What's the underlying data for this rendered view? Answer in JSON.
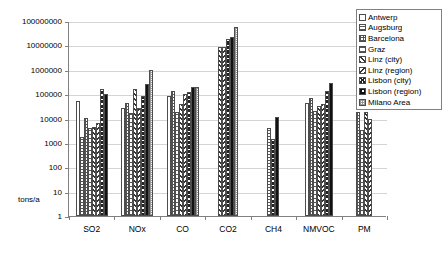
{
  "chart_data": {
    "type": "bar",
    "title": "",
    "subtitle": "",
    "xlabel": "",
    "ylabel": "tons/a",
    "yscale": "log",
    "ylim": [
      1,
      100000000
    ],
    "grid": true,
    "legend_position": "top-right",
    "ytick_labels": [
      "100000000",
      "10000000",
      "1000000",
      "100000",
      "10000",
      "1000",
      "100",
      "10",
      "1"
    ],
    "ytick_values": [
      100000000,
      10000000,
      1000000,
      100000,
      10000,
      1000,
      100,
      10,
      1
    ],
    "categories": [
      "SO2",
      "NOx",
      "CO",
      "CO2",
      "CH4",
      "NMVOC",
      "PM"
    ],
    "series": [
      {
        "name": "Antwerp",
        "pattern": "solid-white",
        "values": [
          50000,
          27000,
          85000,
          null,
          null,
          42000,
          null
        ]
      },
      {
        "name": "Augsburg",
        "pattern": "horizontal-lines",
        "values": [
          1700,
          null,
          null,
          null,
          4000,
          null,
          null
        ]
      },
      {
        "name": "Barcelona",
        "pattern": "fine-grid",
        "values": [
          11000,
          45000,
          140000,
          null,
          null,
          70000,
          18000
        ]
      },
      {
        "name": "Graz",
        "pattern": "wide-horizontal-lines",
        "values": [
          4000,
          17000,
          18000,
          null,
          null,
          21000,
          3500
        ]
      },
      {
        "name": "Linz (city)",
        "pattern": "diagonal-up",
        "values": [
          4600,
          160000,
          38000,
          8500000,
          null,
          32000,
          18000
        ]
      },
      {
        "name": "Linz (region)",
        "pattern": "diagonal-down",
        "values": [
          6500,
          28000,
          100000,
          9000000,
          null,
          40000,
          10000
        ]
      },
      {
        "name": "Lisbon (city)",
        "pattern": "cross-diagonal",
        "values": [
          160000,
          82000,
          120000,
          18000000,
          1500,
          130000,
          null
        ]
      },
      {
        "name": "Lisbon (region)",
        "pattern": "coarse-checker",
        "values": [
          105000,
          250000,
          190000,
          22000000,
          12000,
          300000,
          null
        ]
      },
      {
        "name": "Milano Area",
        "pattern": "light-grid",
        "values": [
          null,
          1000000,
          190000,
          55000000,
          null,
          null,
          null
        ]
      }
    ]
  },
  "legend": {
    "items": [
      {
        "label": "Antwerp"
      },
      {
        "label": "Augsburg"
      },
      {
        "label": "Barcelona"
      },
      {
        "label": "Graz"
      },
      {
        "label": "Linz (city)"
      },
      {
        "label": "Linz (region)"
      },
      {
        "label": "Lisbon (city)"
      },
      {
        "label": "Lisbon (region)"
      },
      {
        "label": "Milano Area"
      }
    ]
  }
}
